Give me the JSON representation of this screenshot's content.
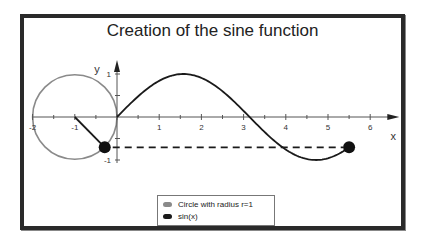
{
  "chart_data": {
    "type": "line",
    "title": "Creation of the sine function",
    "xlabel": "x",
    "ylabel": "y",
    "xlim": [
      -2,
      6.5
    ],
    "ylim": [
      -1,
      1
    ],
    "x_ticks": [
      -2,
      -1,
      1,
      2,
      3,
      4,
      5,
      6
    ],
    "x_tick_labels": [
      "-2",
      "-1",
      "1",
      "2",
      "3",
      "4",
      "5",
      "6"
    ],
    "y_ticks": [
      1,
      -1
    ],
    "y_tick_labels": [
      "1",
      "-1"
    ],
    "grid": false,
    "legend_position": "bottom-center",
    "series": [
      {
        "name": "Circle with radius r=1",
        "kind": "circle",
        "center": [
          -1,
          0
        ],
        "radius": 1,
        "color": "#8a8a8a"
      },
      {
        "name": "sin(x)",
        "kind": "function",
        "x_range": [
          0,
          5.5
        ],
        "color": "#1a1a1a"
      }
    ],
    "annotations": {
      "angle": 5.5,
      "radius_line": {
        "from": [
          -1,
          0
        ],
        "to": [
          -0.291,
          -0.706
        ]
      },
      "circle_point": [
        -0.291,
        -0.706
      ],
      "curve_point": [
        5.5,
        -0.706
      ],
      "dashed_projection": {
        "from_x": -0.291,
        "to_x": 5.5,
        "y": -0.706
      }
    }
  },
  "legend": {
    "items": [
      {
        "label": "Circle with radius r=1",
        "color": "#8a8a8a"
      },
      {
        "label": "sin(x)",
        "color": "#1a1a1a"
      }
    ]
  },
  "axes": {
    "x_label": "x",
    "y_label": "y"
  }
}
